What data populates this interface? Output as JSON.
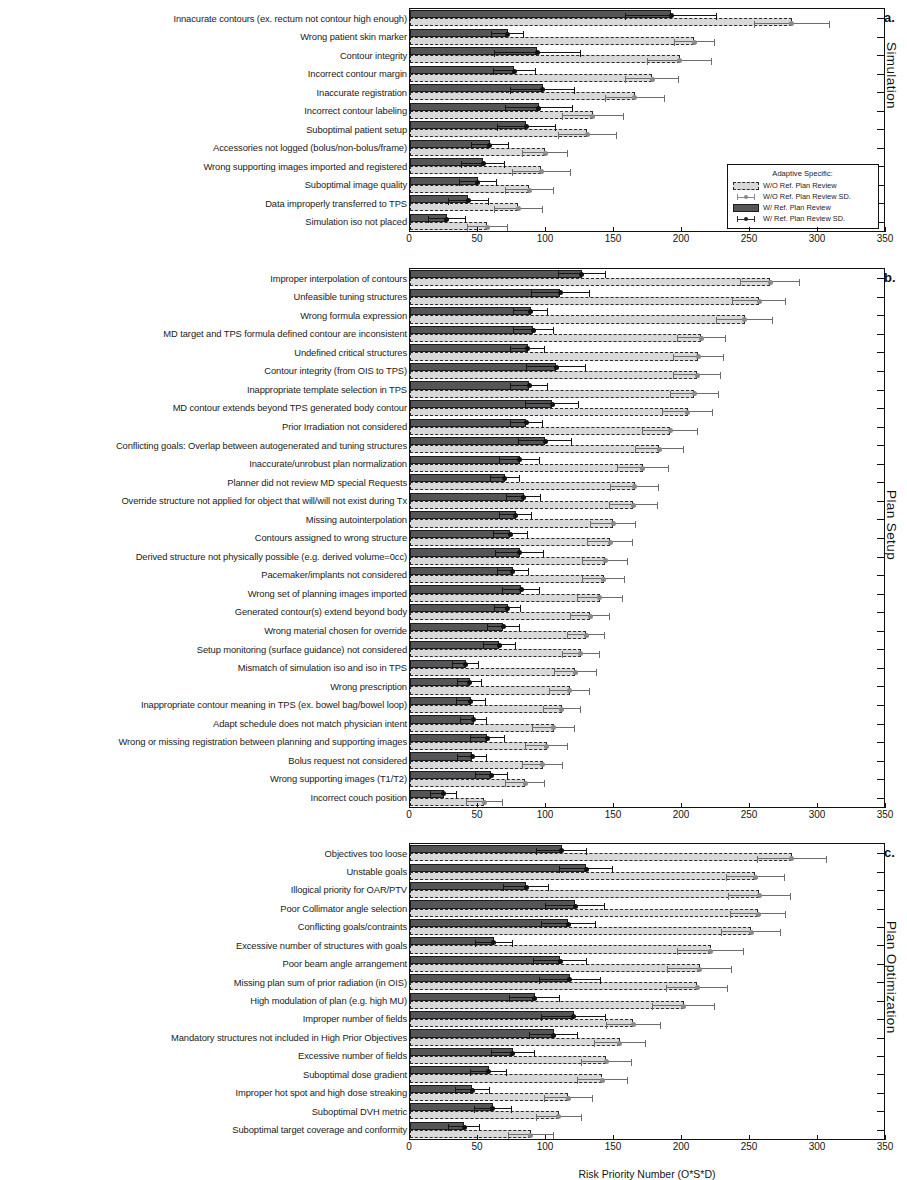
{
  "figure": {
    "xlabel": "Risk Priority Number (O*S*D)",
    "xticks": [
      0,
      50,
      100,
      150,
      200,
      250,
      300,
      350
    ],
    "xlim": [
      0,
      350
    ]
  },
  "legend": {
    "title": "Adaptive Specific:",
    "items": [
      {
        "label": "W/O Ref. Plan Review",
        "type": "swatch-light"
      },
      {
        "label": "W/O Ref. Plan Review SD.",
        "type": "errorbar-light"
      },
      {
        "label": "W/ Ref. Plan Review",
        "type": "swatch-dark"
      },
      {
        "label": "W/ Ref. Plan Review SD.",
        "type": "errorbar-dark"
      }
    ]
  },
  "panels": [
    {
      "letter": "a.",
      "side_title": "Simulation",
      "categories": [
        "Innacurate contours (ex. rectum not contour high enough)",
        "Wrong patient skin marker",
        "Contour integrity",
        "Incorrect contour margin",
        "Inaccurate registration",
        "Incorrect contour labeling",
        "Suboptimal patient setup",
        "Accessories not logged  (bolus/non-bolus/frame)",
        "Wrong supporting images imported and registered",
        "Suboptimal image quality",
        "Data improperly transferred to TPS",
        "Simulation iso not placed"
      ],
      "with_review": [
        193,
        72,
        94,
        77,
        98,
        95,
        86,
        59,
        54,
        50,
        43,
        27
      ],
      "with_review_sd": [
        34,
        12,
        32,
        16,
        24,
        25,
        22,
        14,
        16,
        14,
        15,
        14
      ],
      "without_review": [
        282,
        210,
        199,
        179,
        166,
        135,
        131,
        100,
        97,
        88,
        80,
        57
      ],
      "without_review_sd": [
        28,
        15,
        24,
        20,
        22,
        23,
        22,
        17,
        22,
        18,
        18,
        15
      ]
    },
    {
      "letter": "b.",
      "side_title": "Plan Setup",
      "categories": [
        "Improper interpolation of contours",
        "Unfeasible tuning structures",
        "Wrong formula expression",
        "MD target and TPS formula defined contour are inconsistent",
        "Undefined critical structures",
        "Contour integrity (from OIS to TPS)",
        "Inappropriate template selection in TPS",
        "MD contour extends beyond TPS generated body contour",
        "Prior Irradiation not considered",
        "Conflicting goals: Overlap between autogenerated and tuning structures",
        "Inaccurate/unrobust plan normalization",
        "Planner did not review MD special Requests",
        "Override structure not applied for object that will/will not exist during Tx",
        "Missing autointerpolation",
        "Contours assigned to wrong structure",
        "Derived structure not physically possible (e.g. derived volume=0cc)",
        "Pacemaker/implants not considered",
        "Wrong set of planning images imported",
        "Generated contour(s) extend beyond body",
        "Wrong material chosen for override",
        "Setup monitoring (surface guidance) not considered",
        "Mismatch of simulation iso and iso in TPS",
        "Wrong prescription",
        "Inappropriate contour meaning in TPS (ex. bowel bag/bowel loop)",
        "Adapt schedule does not match physician intent",
        "Wrong or missing registration between planning and supporting images",
        "Bolus request not considered",
        "Wrong supporting images (T1/T2)",
        "Incorrect couch position"
      ],
      "with_review": [
        127,
        111,
        89,
        91,
        87,
        108,
        88,
        105,
        86,
        100,
        81,
        70,
        84,
        78,
        74,
        81,
        76,
        82,
        72,
        69,
        66,
        41,
        44,
        45,
        47,
        57,
        46,
        60,
        25
      ],
      "with_review_sd": [
        18,
        22,
        13,
        15,
        13,
        22,
        14,
        20,
        12,
        20,
        15,
        11,
        13,
        12,
        13,
        18,
        12,
        14,
        10,
        12,
        12,
        10,
        9,
        11,
        10,
        13,
        11,
        12,
        10
      ],
      "without_review": [
        266,
        258,
        247,
        215,
        213,
        212,
        210,
        205,
        192,
        184,
        172,
        166,
        165,
        150,
        148,
        144,
        143,
        140,
        133,
        130,
        126,
        122,
        118,
        112,
        106,
        101,
        98,
        85,
        55
      ],
      "without_review_sd": [
        22,
        20,
        21,
        18,
        19,
        18,
        18,
        19,
        21,
        18,
        19,
        18,
        18,
        17,
        17,
        17,
        16,
        17,
        15,
        14,
        14,
        16,
        15,
        14,
        16,
        16,
        15,
        15,
        14
      ]
    },
    {
      "letter": "c.",
      "side_title": "Plan Optimization",
      "categories": [
        "Objectives too loose",
        "Unstable goals",
        "Illogical priority for OAR/PTV",
        "Poor Collimator angle selection",
        "Conflicting goals/contraints",
        "Excessive number of structures with goals",
        "Poor beam angle arrangement",
        "Missing plan sum of prior radiation (in OIS)",
        "High modulation of plan (e.g. high MU)",
        "Improper number of fields",
        "Mandatory structures not included in High Prior Objectives",
        "Excessive number of fields",
        "Suboptimal dose gradient",
        "Improper hot spot and high dose streaking",
        "Suboptimal DVH metric",
        "Suboptimal target coverage and conformity"
      ],
      "with_review": [
        112,
        130,
        86,
        122,
        117,
        62,
        111,
        118,
        92,
        121,
        106,
        76,
        58,
        46,
        61,
        40
      ],
      "with_review_sd": [
        19,
        20,
        17,
        22,
        20,
        14,
        20,
        23,
        19,
        24,
        18,
        16,
        14,
        13,
        14,
        12
      ],
      "without_review": [
        282,
        255,
        258,
        257,
        252,
        222,
        214,
        212,
        202,
        165,
        155,
        145,
        142,
        117,
        110,
        89
      ],
      "without_review_sd": [
        26,
        22,
        23,
        21,
        22,
        25,
        24,
        23,
        23,
        20,
        19,
        19,
        19,
        18,
        17,
        17
      ]
    }
  ]
}
